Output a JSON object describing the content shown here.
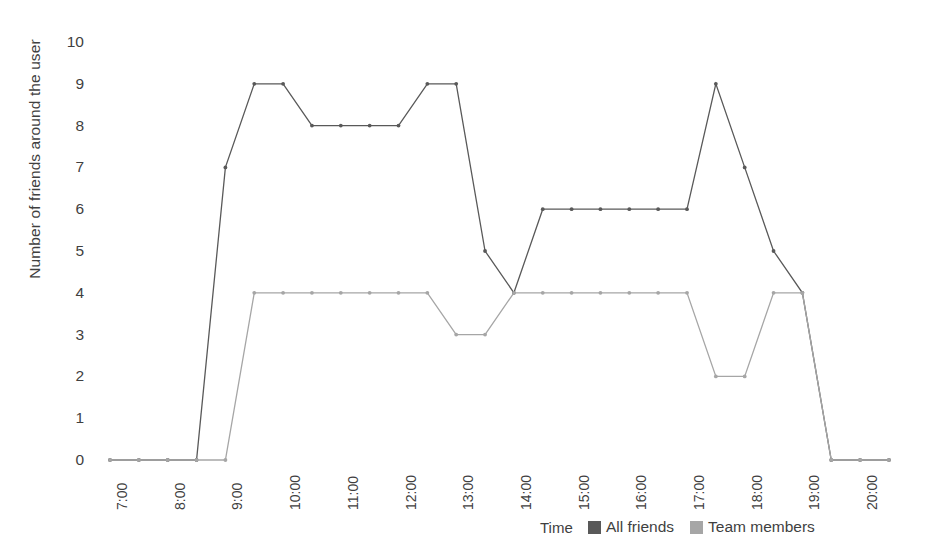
{
  "chart_data": {
    "type": "line",
    "title": "",
    "xlabel": "Time",
    "ylabel": "Number of friends around the user",
    "ylim": [
      0,
      10
    ],
    "ygrid": false,
    "yticks": [
      10,
      9,
      8,
      7,
      6,
      5,
      4,
      3,
      2,
      1,
      0
    ],
    "legend_position": "bottom",
    "x": [
      "7:00",
      "7:30",
      "8:00",
      "8:30",
      "9:00",
      "9:30",
      "10:00",
      "10:30",
      "11:00",
      "11:30",
      "12:00",
      "12:30",
      "13:00",
      "13:30",
      "14:00",
      "14:30",
      "15:00",
      "15:30",
      "16:00",
      "16:30",
      "17:00",
      "17:30",
      "18:00",
      "18:30",
      "19:00",
      "19:30",
      "20:00",
      "20:30"
    ],
    "xticks": [
      "7:00",
      "8:00",
      "9:00",
      "10:00",
      "11:00",
      "12:00",
      "13:00",
      "14:00",
      "15:00",
      "16:00",
      "17:00",
      "18:00",
      "19:00",
      "20:00"
    ],
    "series": [
      {
        "name": "All friends",
        "color": "#595959",
        "values": [
          0,
          0,
          0,
          0,
          7,
          9,
          9,
          8,
          8,
          8,
          8,
          9,
          9,
          5,
          4,
          6,
          6,
          6,
          6,
          6,
          6,
          9,
          7,
          5,
          4,
          0,
          0,
          0
        ]
      },
      {
        "name": "Team members",
        "color": "#a6a6a6",
        "values": [
          0,
          0,
          0,
          0,
          0,
          4,
          4,
          4,
          4,
          4,
          4,
          4,
          3,
          3,
          4,
          4,
          4,
          4,
          4,
          4,
          4,
          2,
          2,
          4,
          4,
          0,
          0,
          0
        ]
      }
    ]
  }
}
